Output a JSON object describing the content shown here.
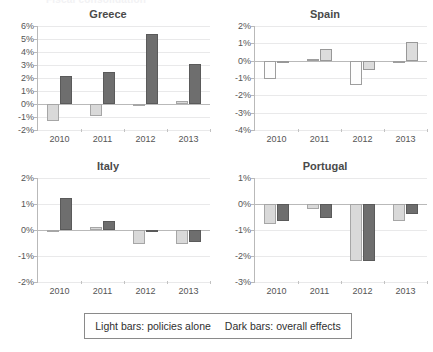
{
  "figure": {
    "clipped_top_title": "Fiscal consolidation",
    "legend": {
      "light_text": "Light bars: policies alone",
      "dark_text": "Dark bars: overall effects"
    },
    "colors": {
      "light_bar": "#d9d9d9",
      "dark_bar": "#6e6e6e",
      "grid": "#e9e9ea",
      "axis": "#b9b9b9"
    }
  },
  "chart_data": [
    {
      "type": "bar",
      "title": "Greece",
      "xlabel": "",
      "ylabel": "",
      "categories": [
        "2010",
        "2011",
        "2012",
        "2013"
      ],
      "ylim": [
        -2,
        6
      ],
      "ytick_labels": [
        "6%",
        "5%",
        "4%",
        "3%",
        "2%",
        "1%",
        "0%",
        "-1%",
        "-2%"
      ],
      "ytick_values": [
        6,
        5,
        4,
        3,
        2,
        1,
        0,
        -1,
        -2
      ],
      "grid": true,
      "legend_position": "figure-bottom",
      "series": [
        {
          "name": "Light bars: policies alone",
          "values": [
            -1.3,
            -0.9,
            -0.15,
            0.2
          ]
        },
        {
          "name": "Dark bars: overall effects",
          "values": [
            2.15,
            2.45,
            5.4,
            3.05
          ]
        }
      ]
    },
    {
      "type": "bar",
      "title": "Spain",
      "xlabel": "",
      "ylabel": "",
      "categories": [
        "2010",
        "2011",
        "2012",
        "2013"
      ],
      "ylim": [
        -4,
        2
      ],
      "ytick_labels": [
        "2%",
        "1%",
        "0%",
        "-1%",
        "-2%",
        "-3%",
        "-4%"
      ],
      "ytick_values": [
        2,
        1,
        0,
        -1,
        -2,
        -3,
        -4
      ],
      "grid": true,
      "legend_position": "figure-bottom",
      "series": [
        {
          "name": "Light bars: policies alone",
          "values": [
            -1.05,
            0.1,
            -1.4,
            -0.02
          ]
        },
        {
          "name": "Dark bars: overall effects",
          "values": [
            -0.08,
            0.65,
            -0.55,
            1.1
          ]
        }
      ]
    },
    {
      "type": "bar",
      "title": "Italy",
      "xlabel": "",
      "ylabel": "",
      "categories": [
        "2010",
        "2011",
        "2012",
        "2013"
      ],
      "ylim": [
        -2,
        2
      ],
      "ytick_labels": [
        "2%",
        "1%",
        "0%",
        "-1%",
        "-2%"
      ],
      "ytick_values": [
        2,
        1,
        0,
        -1,
        -2
      ],
      "grid": true,
      "legend_position": "figure-bottom",
      "series": [
        {
          "name": "Light bars: policies alone",
          "values": [
            -0.03,
            0.1,
            -0.55,
            -0.55
          ]
        },
        {
          "name": "Dark bars: overall effects",
          "values": [
            1.25,
            0.35,
            -0.07,
            -0.45
          ]
        }
      ]
    },
    {
      "type": "bar",
      "title": "Portugal",
      "xlabel": "",
      "ylabel": "",
      "categories": [
        "2010",
        "2011",
        "2012",
        "2013"
      ],
      "ylim": [
        -3,
        1
      ],
      "ytick_labels": [
        "1%",
        "0%",
        "-1%",
        "-2%",
        "-3%"
      ],
      "ytick_values": [
        1,
        0,
        -1,
        -2,
        -3
      ],
      "grid": true,
      "legend_position": "figure-bottom",
      "series": [
        {
          "name": "Light bars: policies alone",
          "values": [
            -0.75,
            -0.2,
            -2.2,
            -0.65
          ]
        },
        {
          "name": "Dark bars: overall effects",
          "values": [
            -0.65,
            -0.55,
            -2.2,
            -0.4
          ]
        }
      ]
    }
  ]
}
